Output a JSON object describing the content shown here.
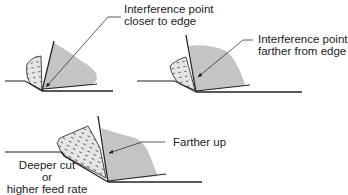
{
  "figures": [
    {
      "id": "fig-closer",
      "label_lines": [
        "Interference point",
        "closer to edge"
      ]
    },
    {
      "id": "fig-farther",
      "label_lines": [
        "Interference point",
        "farther from edge"
      ]
    },
    {
      "id": "fig-deeper",
      "label_lines": [
        "Farther up"
      ],
      "caption_lines": [
        "Deeper cut",
        "or",
        "higher feed rate"
      ]
    }
  ],
  "colors": {
    "line": "#222222",
    "contact_shade": "#c4c4c4",
    "chip_fill": "#e6e6e6"
  }
}
